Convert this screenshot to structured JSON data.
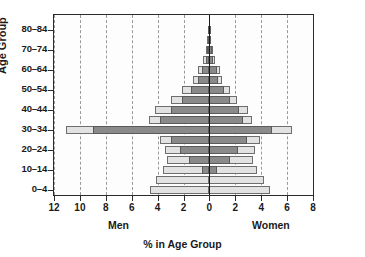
{
  "chart_data": {
    "type": "bar",
    "subtype": "population-pyramid",
    "title": "",
    "xlabel": "% in Age Group",
    "ylabel": "Age Group",
    "grid": "vertical-dashed",
    "legend_position": "none",
    "orientation": "horizontal-bidirectional",
    "xlim": [
      -12,
      8
    ],
    "x_tick_labels": [
      "12",
      "10",
      "8",
      "6",
      "4",
      "2",
      "0",
      "2",
      "4",
      "6",
      "8"
    ],
    "x_tick_values": [
      -12,
      -10,
      -8,
      -6,
      -4,
      -2,
      0,
      2,
      4,
      6,
      8
    ],
    "side_labels": {
      "left": "Men",
      "right": "Women"
    },
    "categories": [
      "0-4",
      "5-9",
      "10-14",
      "15-19",
      "20-24",
      "25-29",
      "30-34",
      "35-39",
      "40-44",
      "45-49",
      "50-54",
      "55-59",
      "60-64",
      "65-69",
      "70-74",
      "75-79",
      "80-84",
      "85+"
    ],
    "y_tick_labels": [
      "0-4",
      "10-14",
      "20-24",
      "30-34",
      "40-44",
      "50-54",
      "60-64",
      "70-74",
      "80-84"
    ],
    "series": [
      {
        "name": "Total population (light)",
        "color": "#e2e2e2",
        "men": [
          4.6,
          4.1,
          3.6,
          3.3,
          3.4,
          3.8,
          11.1,
          4.7,
          4.2,
          3.0,
          2.1,
          1.3,
          0.9,
          0.5,
          0.3,
          0.15,
          0.1,
          0.0
        ],
        "women": [
          4.7,
          4.2,
          3.7,
          3.4,
          3.5,
          3.9,
          6.4,
          3.3,
          3.0,
          2.1,
          1.6,
          1.0,
          0.8,
          0.45,
          0.25,
          0.1,
          0.1,
          0.0
        ]
      },
      {
        "name": "Subgroup (dark)",
        "color": "#8a8a8a",
        "men": [
          0.0,
          0.0,
          0.6,
          1.6,
          2.3,
          3.0,
          9.0,
          3.8,
          3.0,
          2.1,
          1.4,
          0.9,
          0.6,
          0.3,
          0.2,
          0.1,
          0.1,
          0.0
        ],
        "women": [
          0.0,
          0.0,
          0.55,
          1.6,
          2.2,
          2.9,
          4.8,
          2.6,
          2.3,
          1.6,
          1.1,
          0.7,
          0.55,
          0.3,
          0.2,
          0.08,
          0.1,
          0.0
        ]
      }
    ]
  },
  "axes": {
    "y_title": "Age Group",
    "x_title": "% in Age Group"
  }
}
